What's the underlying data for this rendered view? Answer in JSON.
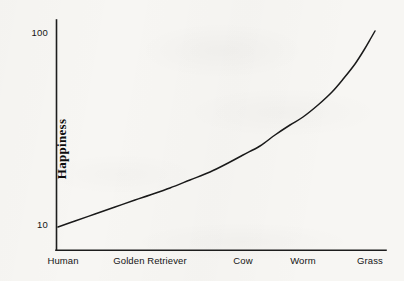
{
  "chart_data": {
    "type": "line",
    "title": "",
    "subtitle": "",
    "xlabel": "",
    "ylabel": "Happiness",
    "yscale": "log",
    "ylim": [
      10,
      100
    ],
    "grid": false,
    "legend": false,
    "ytick_labels": [
      "100",
      "10"
    ],
    "yticks": [
      100,
      10
    ],
    "categories": [
      "Human",
      "Golden Retriever",
      "Cow",
      "Worm",
      "Grass"
    ],
    "values": [
      10,
      16,
      27,
      44,
      100
    ],
    "series": [
      {
        "name": "Happiness",
        "values": [
          10,
          16,
          27,
          44,
          100
        ]
      }
    ],
    "annotations": [],
    "curve_points_px": [
      [
        58,
        227
      ],
      [
        75,
        221
      ],
      [
        95,
        214
      ],
      [
        115,
        207
      ],
      [
        135,
        200
      ],
      [
        150,
        195
      ],
      [
        170,
        188
      ],
      [
        190,
        180
      ],
      [
        210,
        172
      ],
      [
        230,
        162
      ],
      [
        243,
        155
      ],
      [
        260,
        146
      ],
      [
        275,
        135
      ],
      [
        290,
        125
      ],
      [
        303,
        117
      ],
      [
        318,
        105
      ],
      [
        332,
        92
      ],
      [
        344,
        78
      ],
      [
        355,
        64
      ],
      [
        364,
        50
      ],
      [
        371,
        38
      ],
      [
        375,
        31
      ]
    ]
  },
  "axes": {
    "y_axis_name": "y-axis",
    "x_axis_name": "x-axis"
  },
  "colors": {
    "background": "#f7f6f3",
    "axis": "#1d1d1d",
    "curve": "#1a1a1a",
    "text": "#141414"
  }
}
